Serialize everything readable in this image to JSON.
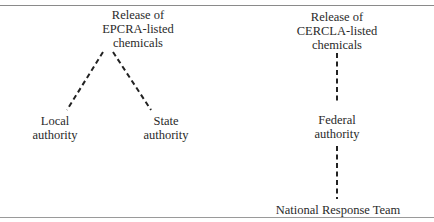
{
  "diagram": {
    "left_tree": {
      "root": {
        "line1": "Release of",
        "line2": "EPCRA-listed",
        "line3": "chemicals"
      },
      "children": [
        {
          "line1": "Local",
          "line2": "authority"
        },
        {
          "line1": "State",
          "line2": "authority"
        }
      ]
    },
    "right_tree": {
      "root": {
        "line1": "Release of",
        "line2": "CERCLA-listed",
        "line3": "chemicals"
      },
      "middle": {
        "line1": "Federal",
        "line2": "authority"
      },
      "leaf": {
        "line1": "National Response Team"
      }
    },
    "edges": [
      {
        "from": "EPCRA release",
        "to": "Local authority",
        "style": "dashed"
      },
      {
        "from": "EPCRA release",
        "to": "State authority",
        "style": "dashed"
      },
      {
        "from": "CERCLA release",
        "to": "Federal authority",
        "style": "dashed"
      },
      {
        "from": "Federal authority",
        "to": "National Response Team",
        "style": "dashed"
      }
    ]
  }
}
